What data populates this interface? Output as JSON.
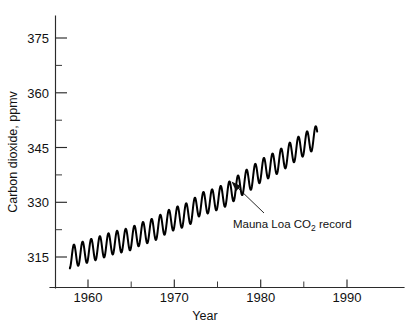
{
  "chart_data": {
    "type": "line",
    "title": "",
    "xlabel": "Year",
    "ylabel": "Carbon dioxide, ppmv",
    "xlim": [
      1956.5,
      1993.0
    ],
    "ylim": [
      309.0,
      381.0
    ],
    "grid": false,
    "legend": null,
    "y_ticks": [
      315,
      330,
      345,
      360,
      375
    ],
    "y_tick_labels": [
      "315",
      "330",
      "345",
      "360",
      "375"
    ],
    "y_minor_ticks": [
      322.5,
      337.5,
      352.5,
      367.5
    ],
    "x_ticks": [
      1960,
      1970,
      1980,
      1990
    ],
    "x_tick_labels": [
      "1960",
      "1970",
      "1980",
      "1990"
    ],
    "x_minor_ticks": [
      1965,
      1975,
      1985
    ],
    "series": [
      {
        "name": "Mauna Loa CO2 record",
        "description": "Monthly atmospheric CO2 concentration showing annual seasonal oscillation superimposed on a rising trend",
        "seasonal_amplitude_ppmv": 3.1,
        "x": [
          1958.0,
          1959.0,
          1960.0,
          1961.0,
          1962.0,
          1963.0,
          1964.0,
          1965.0,
          1966.0,
          1967.0,
          1968.0,
          1969.0,
          1970.0,
          1971.0,
          1972.0,
          1973.0,
          1974.0,
          1975.0,
          1976.0,
          1977.0,
          1978.0,
          1979.0,
          1980.0,
          1981.0,
          1982.0,
          1983.0,
          1984.0,
          1985.0,
          1986.0
        ],
        "annual_mean": [
          315.0,
          315.8,
          316.6,
          317.3,
          318.1,
          318.9,
          319.4,
          320.0,
          321.2,
          322.0,
          322.9,
          324.4,
          325.5,
          326.2,
          327.3,
          329.5,
          330.1,
          331.0,
          332.0,
          333.6,
          335.3,
          336.7,
          338.6,
          339.8,
          341.0,
          342.6,
          344.3,
          345.8,
          347.2
        ]
      }
    ],
    "annotations": [
      {
        "text": "Mauna Loa CO",
        "subscript": "2",
        "text_after": " record",
        "full_text": "Mauna Loa CO2 record",
        "points_to_year": 1979.2,
        "points_to_value": 337.5
      }
    ],
    "colors": {
      "background": "#ffffff",
      "curve": "#000000",
      "axis": "#2b2b2b",
      "text": "#111111"
    }
  },
  "axes": {
    "y_title": "Carbon dioxide, ppmv",
    "x_title": "Year"
  },
  "annotation": {
    "prefix": "Mauna Loa CO",
    "subscript": "2",
    "suffix": " record"
  }
}
